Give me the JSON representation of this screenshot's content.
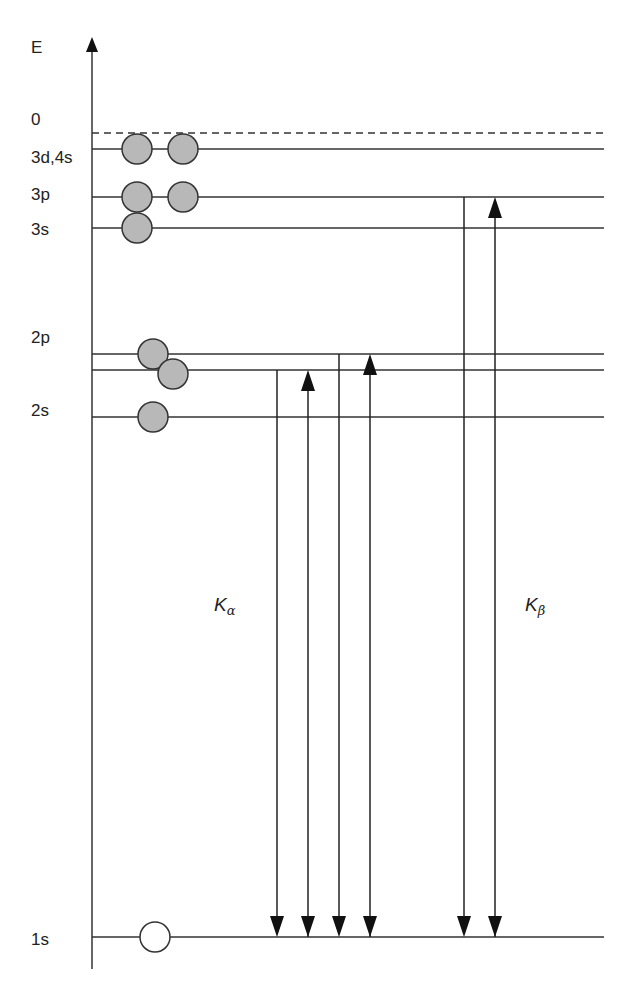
{
  "axis": {
    "label": "E"
  },
  "levels": [
    {
      "label": "0",
      "y": 133,
      "dashed": true
    },
    {
      "label": "3d,4s",
      "y": 149
    },
    {
      "label": "3p",
      "y": 197
    },
    {
      "label": "3s",
      "y": 228
    },
    {
      "label": "2p",
      "y": 354,
      "sublevels": [
        354,
        370
      ]
    },
    {
      "label": "2s",
      "y": 417
    },
    {
      "label": "1s",
      "y": 937
    }
  ],
  "labels": {
    "E": "E",
    "zero": "0",
    "l3d4s": "3d,4s",
    "l3p": "3p",
    "l3s": "3s",
    "l2p": "2p",
    "l2s": "2s",
    "l1s": "1s"
  },
  "electrons": [
    {
      "level": "3d,4s",
      "cx": 137,
      "cy": 149,
      "filled": true
    },
    {
      "level": "3d,4s",
      "cx": 183,
      "cy": 149,
      "filled": true
    },
    {
      "level": "3p",
      "cx": 137,
      "cy": 197,
      "filled": true
    },
    {
      "level": "3p",
      "cx": 183,
      "cy": 197,
      "filled": true
    },
    {
      "level": "3s",
      "cx": 137,
      "cy": 228,
      "filled": true
    },
    {
      "level": "2p",
      "cx": 153,
      "cy": 354,
      "filled": true
    },
    {
      "level": "2p",
      "cx": 173,
      "cy": 374,
      "filled": true
    },
    {
      "level": "2s",
      "cx": 153,
      "cy": 417,
      "filled": true
    },
    {
      "level": "1s",
      "cx": 155,
      "cy": 937,
      "filled": false
    }
  ],
  "transitions": {
    "K_alpha": {
      "label": "K",
      "subscript": "α",
      "arrows": [
        {
          "x": 277,
          "from": 370,
          "to": 937,
          "direction": "down"
        },
        {
          "x": 308,
          "from": 937,
          "to": 370,
          "direction": "up"
        },
        {
          "x": 339,
          "from": 354,
          "to": 937,
          "direction": "down"
        },
        {
          "x": 370,
          "from": 937,
          "to": 354,
          "direction": "up"
        }
      ]
    },
    "K_beta": {
      "label": "K",
      "subscript": "β",
      "arrows": [
        {
          "x": 464,
          "from": 197,
          "to": 937,
          "direction": "down"
        },
        {
          "x": 495,
          "from": 937,
          "to": 197,
          "direction": "up"
        }
      ]
    }
  },
  "colors": {
    "line": "#333333",
    "electron_fill": "#b8b8b8",
    "electron_stroke": "#333333",
    "hole_fill": "#ffffff"
  }
}
